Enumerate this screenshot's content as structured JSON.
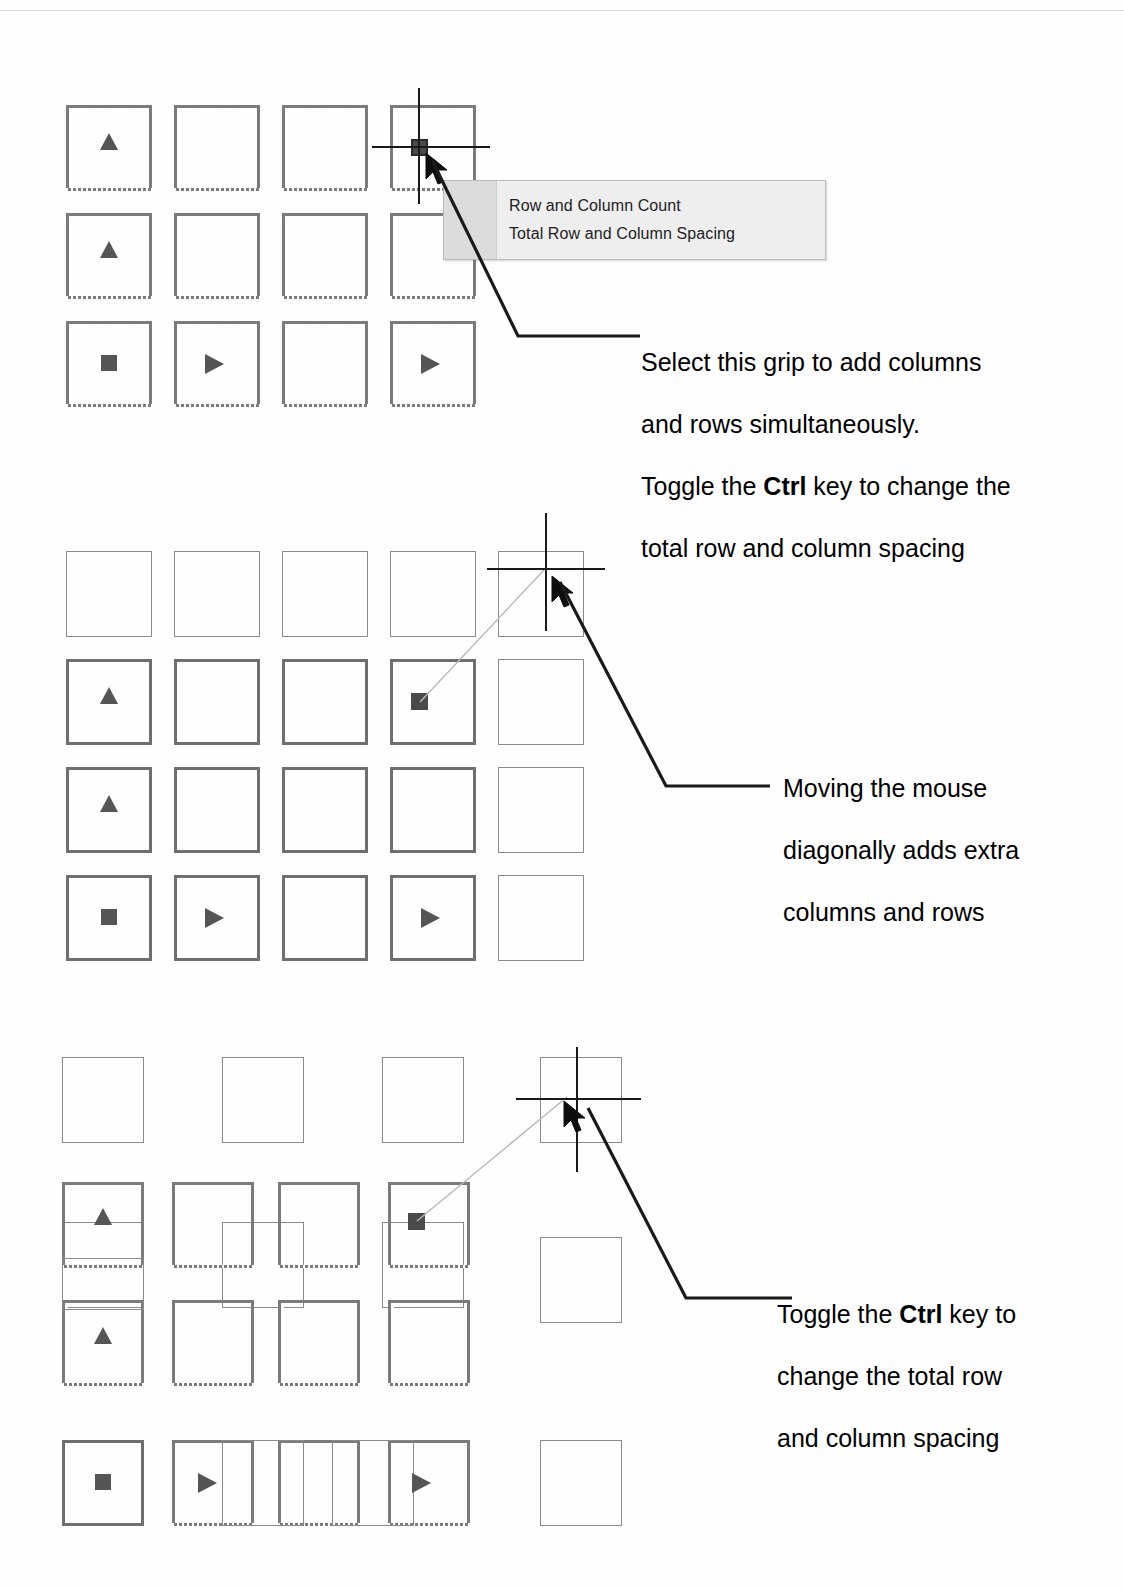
{
  "document": {
    "title": "AutoCAD rectangular array grip editing illustration",
    "background_color": "#ffffff",
    "width": 1124,
    "height": 1589
  },
  "tooltip": {
    "name": "dynamic-input-menu",
    "items": [
      {
        "label": "Row and Column Count"
      },
      {
        "label": "Total Row and Column Spacing"
      }
    ],
    "background_color": "#eeeeee",
    "border_color": "#bcbcbc"
  },
  "callouts": [
    {
      "id": "callout-1",
      "lines": [
        {
          "segments": [
            {
              "text": "Select this grip to add columns",
              "bold": false
            }
          ]
        },
        {
          "segments": [
            {
              "text": "and rows simultaneously.",
              "bold": false
            }
          ]
        },
        {
          "segments": [
            {
              "text": "Toggle the ",
              "bold": false
            },
            {
              "text": "Ctrl",
              "bold": true
            },
            {
              "text": " key to change the",
              "bold": false
            }
          ]
        },
        {
          "segments": [
            {
              "text": "total row and column spacing",
              "bold": false
            }
          ]
        }
      ]
    },
    {
      "id": "callout-2",
      "lines": [
        {
          "segments": [
            {
              "text": "Moving the mouse",
              "bold": false
            }
          ]
        },
        {
          "segments": [
            {
              "text": "diagonally adds extra",
              "bold": false
            }
          ]
        },
        {
          "segments": [
            {
              "text": "columns and rows",
              "bold": false
            }
          ]
        }
      ]
    },
    {
      "id": "callout-3",
      "lines": [
        {
          "segments": [
            {
              "text": "Toggle the ",
              "bold": false
            },
            {
              "text": "Ctrl",
              "bold": true
            },
            {
              "text": " key to",
              "bold": false
            }
          ]
        },
        {
          "segments": [
            {
              "text": "change the total row",
              "bold": false
            }
          ]
        },
        {
          "segments": [
            {
              "text": "and column spacing",
              "bold": false
            }
          ]
        }
      ]
    }
  ],
  "diagrams": [
    {
      "id": "diagram-1",
      "name": "base-array-with-grip-menu",
      "columns": 4,
      "rows": 3,
      "grip_glyphs": [
        {
          "col": 0,
          "row": 0,
          "glyph": "triangle-up"
        },
        {
          "col": 0,
          "row": 1,
          "glyph": "triangle-up"
        },
        {
          "col": 0,
          "row": 2,
          "glyph": "square"
        },
        {
          "col": 1,
          "row": 2,
          "glyph": "arrow-right"
        },
        {
          "col": 3,
          "row": 2,
          "glyph": "arrow-right"
        },
        {
          "col": 3,
          "row": 0,
          "glyph": "selected-grip"
        }
      ],
      "crosshair_at": {
        "col": 3,
        "row": 0
      }
    },
    {
      "id": "diagram-2",
      "name": "array-preview-extra-column-and-row",
      "columns": 5,
      "rows": 4,
      "preview_row": 0,
      "preview_column": 4,
      "grip_glyphs": [
        {
          "col": 0,
          "row": 1,
          "glyph": "triangle-up"
        },
        {
          "col": 0,
          "row": 2,
          "glyph": "triangle-up"
        },
        {
          "col": 0,
          "row": 3,
          "glyph": "square"
        },
        {
          "col": 1,
          "row": 3,
          "glyph": "arrow-right"
        },
        {
          "col": 3,
          "row": 3,
          "glyph": "arrow-right"
        },
        {
          "col": 3,
          "row": 1,
          "glyph": "selected-grip"
        }
      ]
    },
    {
      "id": "diagram-3",
      "name": "array-preview-total-spacing-compressed",
      "columns": 5,
      "rows": 4,
      "preview_row": 0,
      "preview_column": 4,
      "grip_glyphs": [
        {
          "col": 0,
          "row": 1,
          "glyph": "triangle-up"
        },
        {
          "col": 0,
          "row": 2,
          "glyph": "triangle-up"
        },
        {
          "col": 0,
          "row": 3,
          "glyph": "square"
        },
        {
          "col": 1,
          "row": 3,
          "glyph": "arrow-right"
        },
        {
          "col": 3,
          "row": 3,
          "glyph": "arrow-right"
        },
        {
          "col": 3,
          "row": 1,
          "glyph": "selected-grip"
        }
      ]
    }
  ],
  "colors": {
    "array_outline": "#7b7b7b",
    "preview_outline": "#8a8a8a",
    "grip_fill": "#4a4a4a",
    "glyph_fill": "#555555",
    "crosshair": "#1a1a1a",
    "leader": "#1a1a1a",
    "text": "#000000"
  }
}
